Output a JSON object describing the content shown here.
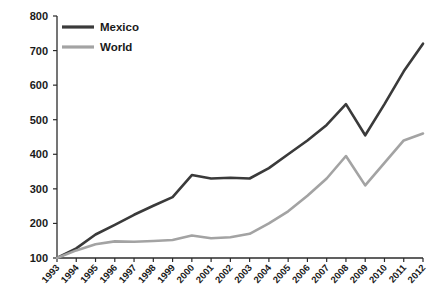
{
  "chart_data": {
    "type": "line",
    "title": "",
    "subtitle": "",
    "xlabel": "",
    "ylabel": "",
    "x": [
      "1993",
      "1994",
      "1995",
      "1996",
      "1997",
      "1998",
      "1999",
      "2000",
      "2001",
      "2002",
      "2003",
      "2004",
      "2005",
      "2006",
      "2007",
      "2008",
      "2009",
      "2010",
      "2011",
      "2012"
    ],
    "categories": [
      "1993",
      "1994",
      "1995",
      "1996",
      "1997",
      "1998",
      "1999",
      "2000",
      "2001",
      "2002",
      "2003",
      "2004",
      "2005",
      "2006",
      "2007",
      "2008",
      "2009",
      "2010",
      "2011",
      "2012"
    ],
    "series": [
      {
        "name": "Mexico",
        "color": "#3a3a3a",
        "values": [
          100,
          128,
          168,
          196,
          225,
          251,
          276,
          340,
          330,
          332,
          330,
          360,
          400,
          440,
          485,
          545,
          455,
          545,
          640,
          720
        ]
      },
      {
        "name": "World",
        "color": "#a3a3a3",
        "values": [
          100,
          122,
          140,
          148,
          147,
          149,
          152,
          165,
          157,
          160,
          170,
          200,
          235,
          280,
          330,
          395,
          310,
          375,
          440,
          460
        ]
      }
    ],
    "ylim": [
      100,
      800
    ],
    "yticks": [
      100,
      200,
      300,
      400,
      500,
      600,
      700,
      800
    ],
    "ytick_labels": [
      "100",
      "200",
      "300",
      "400",
      "500",
      "600",
      "700",
      "800"
    ],
    "grid": false,
    "legend_position": "top-left",
    "legend": [
      "Mexico",
      "World"
    ]
  },
  "legend": {
    "entries": [
      {
        "label": "Mexico",
        "color": "#3a3a3a"
      },
      {
        "label": "World",
        "color": "#a3a3a3"
      }
    ]
  },
  "axes": {
    "y_tick_labels": [
      "800",
      "700",
      "600",
      "500",
      "400",
      "300",
      "200",
      "100"
    ],
    "x_tick_labels": [
      "1993",
      "1994",
      "1995",
      "1996",
      "1997",
      "1998",
      "1999",
      "2000",
      "2001",
      "2002",
      "2003",
      "2004",
      "2005",
      "2006",
      "2007",
      "2008",
      "2009",
      "2010",
      "2011",
      "2012"
    ]
  },
  "colors": {
    "mexico": "#3a3a3a",
    "world": "#a3a3a3",
    "axis": "#2b2b2b",
    "text": "#1a1a1a",
    "background": "#ffffff"
  }
}
